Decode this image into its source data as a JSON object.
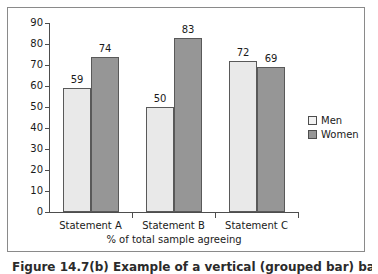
{
  "chart_data": {
    "type": "bar",
    "title": "",
    "subtitle": "",
    "xlabel": "% of total sample agreeing",
    "ylabel": "",
    "categories": [
      "Statement A",
      "Statement B",
      "Statement C"
    ],
    "series": [
      {
        "name": "Men",
        "values": [
          59,
          50,
          72
        ],
        "color": "#e9e9e9"
      },
      {
        "name": "Women",
        "values": [
          74,
          83,
          69
        ],
        "color": "#969696"
      }
    ],
    "ylim": [
      0,
      90
    ],
    "yticks": [
      0,
      10,
      20,
      30,
      40,
      50,
      60,
      70,
      80,
      90
    ],
    "grid": false,
    "legend_position": "right",
    "data_labels": true,
    "annotations": []
  },
  "legend": {
    "entries": [
      {
        "label": "Men",
        "swatch": "legend-swatch-men"
      },
      {
        "label": "Women",
        "swatch": "legend-swatch-women"
      }
    ]
  },
  "caption": {
    "text": "Figure 14.7(b) Example of a vertical (grouped bar) bar chart"
  },
  "colors": {
    "men": "#e9e9e9",
    "women": "#969696",
    "axis": "#4d4d4d",
    "frame": "#8a8a8a",
    "text": "#1a1a1a"
  }
}
